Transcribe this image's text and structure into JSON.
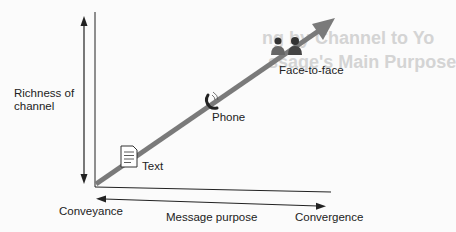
{
  "diagram": {
    "y_axis_label": [
      "Richness of",
      "channel"
    ],
    "x_axis_label": "Message purpose",
    "x_axis_left": "Conveyance",
    "x_axis_right": "Convergence",
    "points": [
      {
        "label": "Text",
        "icon": "document-icon"
      },
      {
        "label": "Phone",
        "icon": "phone-icon"
      },
      {
        "label": "Face-to-face",
        "icon": "people-icon"
      }
    ],
    "colors": {
      "trend_arrow": "#7a7a7a",
      "axes": "#222222"
    },
    "bleed_through_text": [
      "ng by Channel to Yo",
      "ssage's Main Purpose"
    ]
  }
}
